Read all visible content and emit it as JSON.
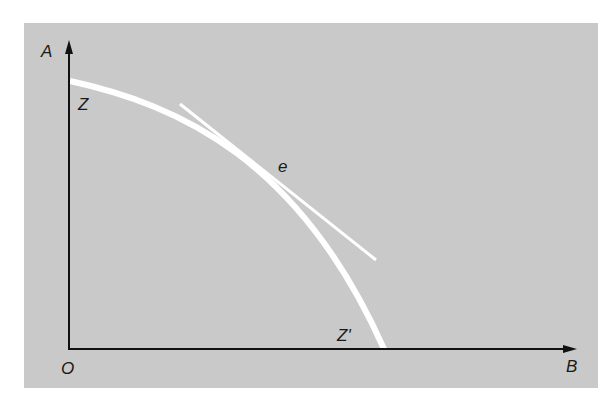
{
  "diagram": {
    "type": "production-possibility-frontier",
    "axes": {
      "y_label": "A",
      "x_label": "B",
      "origin_label": "O"
    },
    "curve": {
      "start_label": "Z",
      "end_label": "Z'"
    },
    "tangent_point_label": "e",
    "colors": {
      "background": "#c9c9c9",
      "curve": "#ffffff",
      "axes": "#111111"
    }
  }
}
